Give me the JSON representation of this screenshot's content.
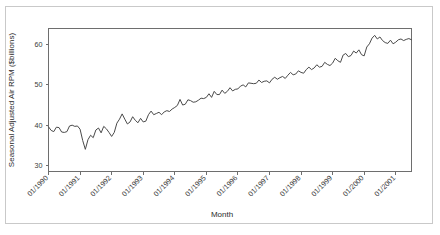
{
  "chart_data": {
    "type": "line",
    "title": "",
    "xlabel": "Month",
    "ylabel": "Seasonal Adjusted Air RPM ($billions)",
    "grid": false,
    "legend": false,
    "legend_position": "none",
    "line_color": "#4a4a4a",
    "frame_color": "#6e6e6e",
    "background_color": "#ffffff",
    "border_color": "#c9c9c9",
    "ylim": [
      28.5,
      64.0
    ],
    "yticks": [
      30,
      40,
      50,
      60
    ],
    "ytick_labels": [
      "30",
      "40",
      "50",
      "60"
    ],
    "xlim": [
      "01/1990",
      "07/2001"
    ],
    "xticks": [
      "01/1990",
      "01/1991",
      "01/1992",
      "01/1993",
      "01/1994",
      "01/1995",
      "01/1996",
      "01/1997",
      "01/1998",
      "01/1999",
      "01/2000",
      "01/2001"
    ],
    "xtick_rotation": 45,
    "x_start_label": "01/1990",
    "x_end_label": "07/2001",
    "series": [
      {
        "name": "Seasonal Adjusted Air RPM",
        "x": [
          "01/1990",
          "02/1990",
          "03/1990",
          "04/1990",
          "05/1990",
          "06/1990",
          "07/1990",
          "08/1990",
          "09/1990",
          "10/1990",
          "11/1990",
          "12/1990",
          "01/1991",
          "02/1991",
          "03/1991",
          "04/1991",
          "05/1991",
          "06/1991",
          "07/1991",
          "08/1991",
          "09/1991",
          "10/1991",
          "11/1991",
          "12/1991",
          "01/1992",
          "02/1992",
          "03/1992",
          "04/1992",
          "05/1992",
          "06/1992",
          "07/1992",
          "08/1992",
          "09/1992",
          "10/1992",
          "11/1992",
          "12/1992",
          "01/1993",
          "02/1993",
          "03/1993",
          "04/1993",
          "05/1993",
          "06/1993",
          "07/1993",
          "08/1993",
          "09/1993",
          "10/1993",
          "11/1993",
          "12/1993",
          "01/1994",
          "02/1994",
          "03/1994",
          "04/1994",
          "05/1994",
          "06/1994",
          "07/1994",
          "08/1994",
          "09/1994",
          "10/1994",
          "11/1994",
          "12/1994",
          "01/1995",
          "02/1995",
          "03/1995",
          "04/1995",
          "05/1995",
          "06/1995",
          "07/1995",
          "08/1995",
          "09/1995",
          "10/1995",
          "11/1995",
          "12/1995",
          "01/1996",
          "02/1996",
          "03/1996",
          "04/1996",
          "05/1996",
          "06/1996",
          "07/1996",
          "08/1996",
          "09/1996",
          "10/1996",
          "11/1996",
          "12/1996",
          "01/1997",
          "02/1997",
          "03/1997",
          "04/1997",
          "05/1997",
          "06/1997",
          "07/1997",
          "08/1997",
          "09/1997",
          "10/1997",
          "11/1997",
          "12/1997",
          "01/1998",
          "02/1998",
          "03/1998",
          "04/1998",
          "05/1998",
          "06/1998",
          "07/1998",
          "08/1998",
          "09/1998",
          "10/1998",
          "11/1998",
          "12/1998",
          "01/1999",
          "02/1999",
          "03/1999",
          "04/1999",
          "05/1999",
          "06/1999",
          "07/1999",
          "08/1999",
          "09/1999",
          "10/1999",
          "11/1999",
          "12/1999",
          "01/2000",
          "02/2000",
          "03/2000",
          "04/2000",
          "05/2000",
          "06/2000",
          "07/2000",
          "08/2000",
          "09/2000",
          "10/2000",
          "11/2000",
          "12/2000",
          "01/2001",
          "02/2001",
          "03/2001",
          "04/2001",
          "05/2001",
          "06/2001",
          "07/2001"
        ],
        "values": [
          39.6,
          38.7,
          38.4,
          39.5,
          39.4,
          38.3,
          38.2,
          38.4,
          39.8,
          40.0,
          39.7,
          39.8,
          39.0,
          36.2,
          34.0,
          36.4,
          37.5,
          36.9,
          38.8,
          39.3,
          38.1,
          39.7,
          39.1,
          38.2,
          37.2,
          38.2,
          40.5,
          41.5,
          42.8,
          41.5,
          40.3,
          40.8,
          42.1,
          41.2,
          40.6,
          41.7,
          40.8,
          41.0,
          42.6,
          43.5,
          42.6,
          42.9,
          43.2,
          42.6,
          43.3,
          43.6,
          43.4,
          44.0,
          44.4,
          44.9,
          46.4,
          45.0,
          45.2,
          46.3,
          46.1,
          45.7,
          45.8,
          46.2,
          46.7,
          46.6,
          46.9,
          47.8,
          46.9,
          48.4,
          47.6,
          47.6,
          48.7,
          47.9,
          48.4,
          49.3,
          48.5,
          48.9,
          49.0,
          49.7,
          50.0,
          49.5,
          50.5,
          50.4,
          50.3,
          50.4,
          51.2,
          50.6,
          50.9,
          51.0,
          50.5,
          51.4,
          51.9,
          51.4,
          51.8,
          52.1,
          51.6,
          52.4,
          53.1,
          52.5,
          52.7,
          53.5,
          53.1,
          52.9,
          53.8,
          54.4,
          53.8,
          54.2,
          55.0,
          54.4,
          54.6,
          55.6,
          55.1,
          54.8,
          55.4,
          56.6,
          56.0,
          55.6,
          57.4,
          57.8,
          57.0,
          57.3,
          58.4,
          57.9,
          58.7,
          57.5,
          57.2,
          59.4,
          60.2,
          61.6,
          62.3,
          61.4,
          61.9,
          61.0,
          60.5,
          60.3,
          61.1,
          60.2,
          60.6,
          61.2,
          61.4,
          61.0,
          61.3,
          61.5,
          61.2
        ]
      }
    ]
  }
}
